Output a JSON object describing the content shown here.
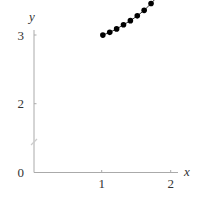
{
  "chart_data": {
    "type": "line",
    "title": "",
    "xlabel": "x",
    "ylabel": "y",
    "xlim": [
      0,
      2.1
    ],
    "ylim": [
      0,
      3.1
    ],
    "x_ticks": [
      "1",
      "2"
    ],
    "y_ticks": [
      "0",
      "2",
      "3"
    ],
    "y_axis_break": true,
    "grid": false,
    "legend": null,
    "series": [
      {
        "name": "data",
        "marker": "filled-circle",
        "color": "#000000",
        "x": [
          1.0,
          1.1,
          1.2,
          1.3,
          1.4,
          1.5,
          1.6,
          1.7,
          1.8,
          1.9
        ],
        "values": [
          2.0,
          2.04,
          2.09,
          2.15,
          2.21,
          2.28,
          2.36,
          2.46,
          2.57,
          2.7
        ]
      }
    ]
  },
  "labels": {
    "x_axis": "x",
    "y_axis": "y",
    "xtick_1": "1",
    "xtick_2": "2",
    "ytick_0": "0",
    "ytick_2": "2",
    "ytick_3": "3"
  }
}
